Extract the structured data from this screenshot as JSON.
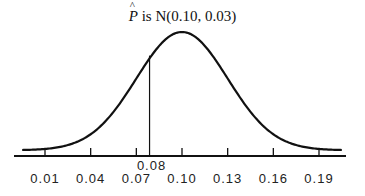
{
  "chart_data": {
    "type": "line",
    "title_parts": {
      "variable": "P",
      "rest": " is N(0.10, 0.03)"
    },
    "distribution": {
      "name": "normal",
      "mean": 0.1,
      "sd": 0.03
    },
    "xlabel": "",
    "ylabel": "",
    "xlim": [
      -0.01,
      0.21
    ],
    "x_ticks": [
      0.01,
      0.04,
      0.07,
      0.1,
      0.13,
      0.16,
      0.19
    ],
    "x_tick_labels": [
      "0.01",
      "0.04",
      "0.07",
      "0.10",
      "0.13",
      "0.16",
      "0.19"
    ],
    "marker": {
      "x": 0.08,
      "label": "0.08"
    },
    "grid": false,
    "legend": null,
    "colors": {
      "curve": "#111111",
      "axis": "#111111",
      "text": "#222222"
    }
  }
}
